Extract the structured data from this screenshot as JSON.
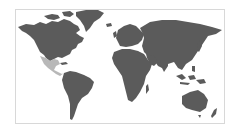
{
  "map": {
    "type": "world-choropleth",
    "colors": {
      "land": "#5b5b5b",
      "highlight": "#b8b8b8",
      "water": "#ffffff",
      "border": "#d8d8d8"
    },
    "highlighted_regions": [
      "Mexico",
      "Central America"
    ],
    "continents": [
      "North America",
      "Greenland",
      "South America",
      "Europe",
      "Africa",
      "Asia",
      "Australia",
      "New Zealand",
      "Indonesia"
    ]
  }
}
